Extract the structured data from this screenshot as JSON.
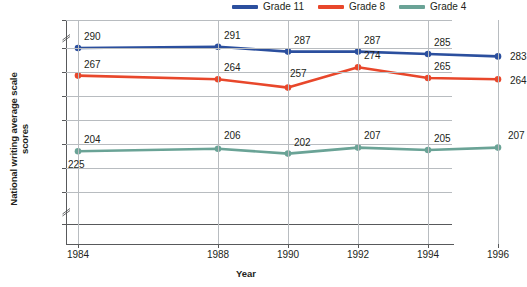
{
  "legend": {
    "position": "top-right",
    "items": [
      {
        "label": "Grade 11",
        "color": "#2b4f9e",
        "icon": "line-swatch"
      },
      {
        "label": "Grade 8",
        "color": "#e8472b",
        "icon": "line-swatch"
      },
      {
        "label": "Grade 4",
        "color": "#6aa396",
        "icon": "line-swatch"
      }
    ]
  },
  "axes": {
    "ylabel": "National writing average scale scores",
    "xlabel": "Year",
    "yticks": [
      "500",
      "290",
      "270",
      "250",
      "230",
      "210",
      "190",
      "170",
      "0"
    ],
    "xticks": [
      "1984",
      "1988",
      "1990",
      "1992",
      "1994",
      "1996"
    ],
    "y_axis_break": true
  },
  "stray_label": "225",
  "chart_data": {
    "type": "line",
    "title": "",
    "subtitle": "",
    "xlabel": "Year",
    "ylabel": "National writing average scale scores",
    "x": [
      1984,
      1988,
      1990,
      1992,
      1994,
      1996
    ],
    "categories": [
      "1984",
      "1988",
      "1990",
      "1992",
      "1994",
      "1996"
    ],
    "ylim": [
      170,
      290
    ],
    "ytick_values": [
      500,
      290,
      270,
      250,
      230,
      210,
      190,
      170,
      0
    ],
    "grid": true,
    "legend_position": "top-right",
    "axis_break": "y-axis broken between 0-170 and 290-500",
    "series": [
      {
        "name": "Grade 11",
        "color": "#2b4f9e",
        "values": [
          290,
          291,
          287,
          287,
          285,
          283
        ],
        "labels": [
          "290",
          "291",
          "287",
          "287",
          "285",
          "283"
        ]
      },
      {
        "name": "Grade 8",
        "color": "#e8472b",
        "values": [
          267,
          264,
          257,
          274,
          265,
          264
        ],
        "labels": [
          "267",
          "264",
          "257",
          "274",
          "265",
          "264"
        ]
      },
      {
        "name": "Grade 4",
        "color": "#6aa396",
        "values": [
          204,
          206,
          202,
          207,
          205,
          207
        ],
        "labels": [
          "204",
          "206",
          "202",
          "207",
          "205",
          "207"
        ]
      }
    ],
    "annotations": [
      {
        "text": "225",
        "near": "Grade 4 at 1984",
        "note": "stray label below first Grade 4 point"
      }
    ]
  }
}
